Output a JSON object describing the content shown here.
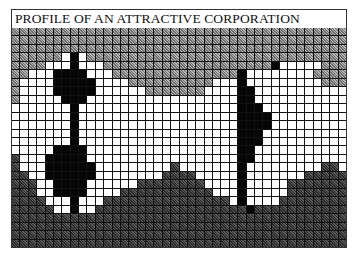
{
  "title": "PROFILE OF AN ATTRACTIVE CORPORATION",
  "grid": {
    "columns": 40,
    "rows": 26,
    "legend": {
      "g": "light grey hatched",
      "w": "white",
      "b": "black",
      "d": "dark grey hatched"
    },
    "colors": {
      "g": "#8c8c8c",
      "w": "#ffffff",
      "b": "#050505",
      "d": "#3a3a3a",
      "gridline": "#111111"
    },
    "cells": [
      "gggggggggggggggggggggggggggggggggggggggg",
      "gggggggggggggggggggggggggggggggggggggggg",
      "gggggggggggggggggggggggggggggggggggggggg",
      "ggggggwbwggggggggggggggggggggggggggggggg",
      "ggggwwwbwwwggggggggggggggggggggbwwwwwggggggg",
      "ggwwwbbbbwwwgggggggggggggggbwwwwwwwwgggg",
      "gwwwwbbbbbwwwwggggggggggwwwbwwwwwwwwwggg",
      "gwwwwbbbbbwwwwwwgggggggwwwwbbwwwwwwwwwww",
      "gwwwwwbbbwwwwwwwwwwwwwwwwwwbbwwwwwwwwwww",
      "wwwwwwwbwwwwwwwwwwwwwwwwwwwbbbwwwwwwwwww",
      "wwwwwwwbwwwwwwwwwwwwwwwwwwwbbbbwwwwwwwww",
      "wwwwwwwbwwwwwwwwwwwwwwwwwwwbbbbwwwwwwwww",
      "wwwwwwwbwwwwwwwwwwwwwwwwwwwbbbwwwwwwwwww",
      "wwwwwwwbwwwwwwwwwwwwwwwwwwwbbbwwwwwwwwww",
      "wwwwwbbbbwwwwwwwwwwwwwwwwwwbbwwwwwwwwwww",
      "dwwwbbbbbwwwwwwwwwwwwwwwwwwbbwwwwwwwwwww",
      "dwwwbbbbbbwwwwwwwwwdwwwwwwwbwwwwwwwwwddw",
      "ddwwbbbbbbwwwwwwwwddddwwwwwbwwwwwwwddddd",
      "dddwwbbbbwwwwwwddddddddwwwwbwwwwwddddddd",
      "dddwwbbbbwwwwdddddddddddwwwbwwwwwddddddd",
      "ddddwwwbwwwdddddddddddddddwbwwwwdddddddd",
      "dddddwwbwwddddddddddddddddddbdddddddddddd",
      "dddddddddddddddddddddddddddddddddddddddd",
      "dddddddddddddddddddddddddddddddddddddddd",
      "dddddddddddddddddddddddddddddddddddddddd",
      "dddddddddddddddddddddddddddddddddddddddd"
    ]
  }
}
